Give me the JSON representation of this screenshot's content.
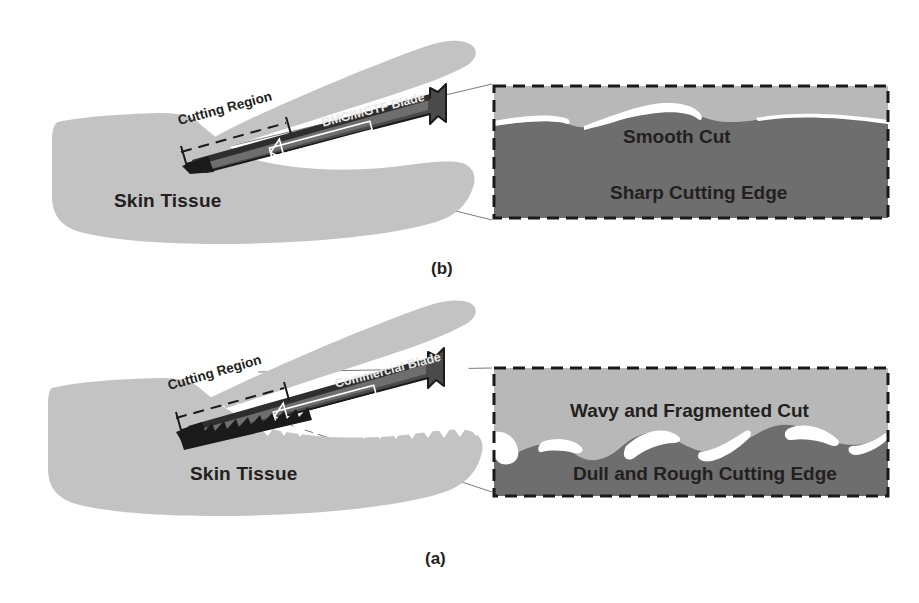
{
  "figure": {
    "colors": {
      "skin_tissue": "#c3c3c3",
      "inset_upper": "#b8b8b8",
      "inset_lower": "#6e6e6e",
      "blade_dark": "#4a4a4a",
      "blade_outline": "#1a1a1a",
      "text": "#231f20",
      "background": "#ffffff",
      "fragment_white": "#ffffff"
    }
  },
  "panel_b": {
    "caption": "(b)",
    "skin_label": "Skin Tissue",
    "cutting_region_label": "Cutting Region",
    "blade_label": "BMG/MGTF Blade",
    "edge_style": "smooth",
    "inset": {
      "upper_label": "Smooth Cut",
      "lower_label": "Sharp Cutting Edge",
      "boundary": "gentle-wave"
    }
  },
  "panel_a": {
    "caption": "(a)",
    "skin_label": "Skin Tissue",
    "cutting_region_label": "Cutting Region",
    "blade_label": "Commercial Blade",
    "edge_style": "serrated",
    "inset": {
      "upper_label": "Wavy and Fragmented Cut",
      "lower_label": "Dull and Rough Cutting Edge",
      "boundary": "rough-wave-with-fragments"
    }
  }
}
